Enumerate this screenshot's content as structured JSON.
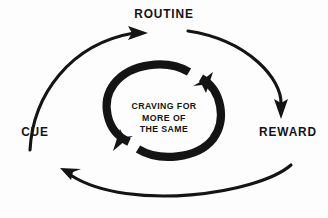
{
  "diagram": {
    "type": "cycle-diagram",
    "background_color": "#fdfdfd",
    "stroke_color": "#141414",
    "nodes": [
      {
        "id": "cue",
        "label": "CUE",
        "position": "left"
      },
      {
        "id": "routine",
        "label": "ROUTINE",
        "position": "top"
      },
      {
        "id": "reward",
        "label": "REWARD",
        "position": "right"
      }
    ],
    "center": {
      "lines": [
        "CRAVING FOR",
        "MORE OF",
        "THE SAME"
      ],
      "line1": "CRAVING FOR",
      "line2": "MORE OF",
      "line3": "THE SAME"
    },
    "outer_arrows": [
      {
        "id": "cue-to-routine",
        "from": "CUE",
        "to": "ROUTINE",
        "arrowhead": "right"
      },
      {
        "id": "routine-to-reward",
        "from": "ROUTINE",
        "to": "REWARD",
        "arrowhead": "down"
      },
      {
        "id": "reward-to-cue",
        "from": "REWARD",
        "to": "CUE",
        "arrowhead": "up-left"
      }
    ],
    "inner_arrows": [
      {
        "id": "inner-arc-top",
        "arrowhead": "down-right"
      },
      {
        "id": "inner-arc-bottom",
        "arrowhead": "up-left"
      }
    ]
  }
}
